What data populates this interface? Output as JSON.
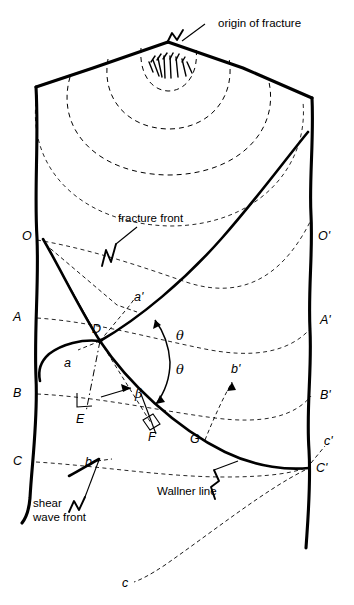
{
  "figure": {
    "background_color": "#ffffff",
    "ink_color": "#000000",
    "width": 354,
    "height": 605
  },
  "annotations": {
    "origin_of_fracture": "origin of fracture",
    "fracture_front": "fracture front",
    "wallner_line": "Wallner line",
    "shear_wave_front_line1": "shear",
    "shear_wave_front_line2": "wave front"
  },
  "points": {
    "O": "O",
    "O_prime": "O'",
    "A": "A",
    "A_prime": "A'",
    "B": "B",
    "B_prime": "B'",
    "C": "C",
    "C_prime": "C'",
    "D": "D",
    "E": "E",
    "F": "F",
    "G": "G"
  },
  "rays": {
    "a": "a",
    "a_prime": "a'",
    "b": "b",
    "b_prime": "b'",
    "c": "c",
    "c_prime": "c'"
  },
  "angles": {
    "theta_upper": "θ",
    "theta_lower": "θ",
    "beta": "β"
  }
}
